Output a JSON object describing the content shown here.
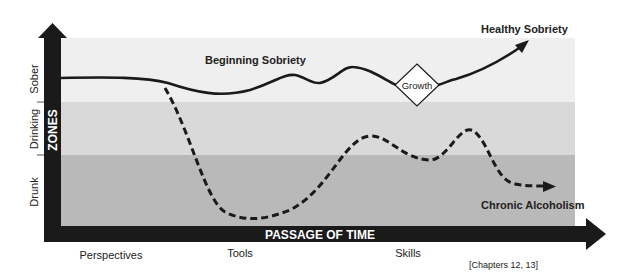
{
  "diagram": {
    "colors": {
      "sober_zone": "#efefef",
      "drinking_zone": "#d9d9d9",
      "drunk_zone": "#b9b9b9",
      "axis_bar": "#1a1a1a",
      "line": "#1a1a1a",
      "axis_text": "#ffffff",
      "label_text": "#222222"
    },
    "y_axis": {
      "title": "ZONES",
      "zones": [
        {
          "label": "Sober"
        },
        {
          "label": "Drinking"
        },
        {
          "label": "Drunk"
        }
      ]
    },
    "x_axis": {
      "title": "PASSAGE OF TIME",
      "labels": [
        "Perspectives",
        "Tools",
        "Skills"
      ]
    },
    "curves": {
      "solid": {
        "start_label": "Beginning Sobriety",
        "end_label": "Healthy Sobriety",
        "milestone_label": "Growth"
      },
      "dashed": {
        "end_label": "Chronic Alcoholism"
      }
    },
    "footnote": "[Chapters 12, 13]"
  }
}
